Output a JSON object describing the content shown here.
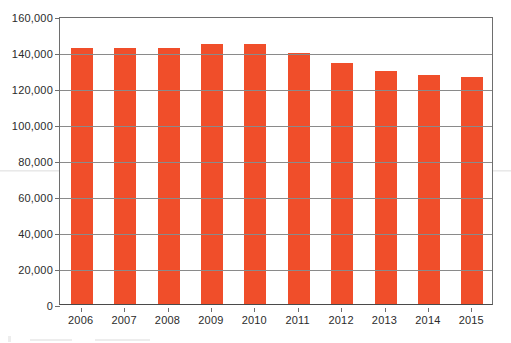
{
  "chart_data": {
    "type": "bar",
    "title": "",
    "subtitle": "",
    "xlabel": "",
    "ylabel": "",
    "categories": [
      "2006",
      "2007",
      "2008",
      "2009",
      "2010",
      "2011",
      "2012",
      "2013",
      "2014",
      "2015"
    ],
    "values": [
      142000,
      142000,
      142000,
      144500,
      144500,
      139500,
      134000,
      129500,
      127500,
      126000
    ],
    "series": [
      {
        "name": "",
        "values": [
          142000,
          142000,
          142000,
          144500,
          144500,
          139500,
          134000,
          129500,
          127500,
          126000
        ]
      }
    ],
    "ylim": [
      0,
      160000
    ],
    "y_ticks": [
      0,
      20000,
      40000,
      60000,
      80000,
      100000,
      120000,
      140000,
      160000
    ],
    "y_tick_labels": [
      "0",
      "20,000",
      "40,000",
      "60,000",
      "80,000",
      "100,000",
      "120,000",
      "140,000",
      "160,000"
    ],
    "grid": true,
    "grid_axis": "y",
    "legend": false,
    "legend_position": "none",
    "bar_color": "#f04e2a",
    "grid_color": "#8a8a8a",
    "axis_color": "#6e6e6e",
    "background_color": "#ffffff",
    "annotations": []
  }
}
